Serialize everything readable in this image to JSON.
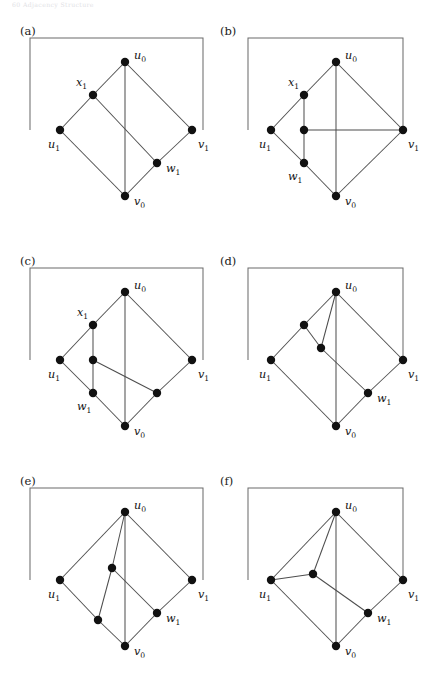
{
  "page": {
    "header_text": "60   Adjacency Structure",
    "background": "#ffffff",
    "node_color": "#111111",
    "edge_color": "#4d4d4d",
    "frame_color": "#6a6a6a",
    "width": 435,
    "height": 678
  },
  "figure": {
    "type": "graph-diagram-grid",
    "rows": 3,
    "cols": 2,
    "panel_count": 6
  },
  "panels": [
    {
      "id": "a",
      "label": "(a)",
      "origin": [
        20,
        20
      ],
      "frame": [
        [
          10,
          18
        ],
        [
          183,
          18
        ],
        [
          183,
          110
        ]
      ],
      "frame_left_end": [
        10,
        110
      ],
      "nodes": [
        {
          "name": "u0",
          "label": "u",
          "sub": "0",
          "x": 105,
          "y": 42,
          "lx": 114,
          "ly": 39
        },
        {
          "name": "x1",
          "label": "x",
          "sub": "1",
          "x": 73,
          "y": 75,
          "lx": 56,
          "ly": 66
        },
        {
          "name": "u1",
          "label": "u",
          "sub": "1",
          "x": 40,
          "y": 110,
          "lx": 28,
          "ly": 128
        },
        {
          "name": "v1",
          "label": "v",
          "sub": "1",
          "x": 172,
          "y": 110,
          "lx": 178,
          "ly": 128
        },
        {
          "name": "w1",
          "label": "w",
          "sub": "1",
          "x": 137,
          "y": 143,
          "lx": 146,
          "ly": 152
        },
        {
          "name": "v0",
          "label": "v",
          "sub": "0",
          "x": 105,
          "y": 176,
          "lx": 114,
          "ly": 185
        }
      ],
      "edges": [
        [
          "u1",
          "x1"
        ],
        [
          "x1",
          "u0"
        ],
        [
          "u0",
          "v1"
        ],
        [
          "u0",
          "v0"
        ],
        [
          "x1",
          "w1"
        ],
        [
          "u1",
          "v0"
        ],
        [
          "v0",
          "w1"
        ],
        [
          "w1",
          "v1"
        ]
      ]
    },
    {
      "id": "b",
      "label": "(b)",
      "origin": [
        220,
        20
      ],
      "frame": [
        [
          28,
          18
        ],
        [
          183,
          18
        ],
        [
          183,
          110
        ]
      ],
      "frame_left_end": [
        28,
        110
      ],
      "nodes": [
        {
          "name": "u0",
          "label": "u",
          "sub": "0",
          "x": 116,
          "y": 42,
          "lx": 125,
          "ly": 39
        },
        {
          "name": "x1",
          "label": "x",
          "sub": "1",
          "x": 84,
          "y": 75,
          "lx": 68,
          "ly": 66
        },
        {
          "name": "u1",
          "label": "u",
          "sub": "1",
          "x": 51,
          "y": 110,
          "lx": 39,
          "ly": 128
        },
        {
          "name": "m1",
          "label": "",
          "sub": "",
          "x": 84,
          "y": 110,
          "lx": 0,
          "ly": 0
        },
        {
          "name": "w1",
          "label": "w",
          "sub": "1",
          "x": 84,
          "y": 143,
          "lx": 68,
          "ly": 160
        },
        {
          "name": "v1",
          "label": "v",
          "sub": "1",
          "x": 183,
          "y": 110,
          "lx": 188,
          "ly": 128
        },
        {
          "name": "v0",
          "label": "v",
          "sub": "0",
          "x": 116,
          "y": 176,
          "lx": 125,
          "ly": 185
        }
      ],
      "edges": [
        [
          "u1",
          "x1"
        ],
        [
          "x1",
          "u0"
        ],
        [
          "u0",
          "v1"
        ],
        [
          "u0",
          "v0"
        ],
        [
          "x1",
          "m1"
        ],
        [
          "m1",
          "w1"
        ],
        [
          "m1",
          "v1"
        ],
        [
          "u1",
          "w1"
        ],
        [
          "w1",
          "v0"
        ],
        [
          "v0",
          "v1"
        ]
      ]
    },
    {
      "id": "c",
      "label": "(c)",
      "origin": [
        20,
        250
      ],
      "frame": [
        [
          10,
          18
        ],
        [
          183,
          18
        ],
        [
          183,
          110
        ]
      ],
      "frame_left_end": [
        10,
        110
      ],
      "nodes": [
        {
          "name": "u0",
          "label": "u",
          "sub": "0",
          "x": 105,
          "y": 42,
          "lx": 114,
          "ly": 39
        },
        {
          "name": "x1",
          "label": "x",
          "sub": "1",
          "x": 73,
          "y": 75,
          "lx": 57,
          "ly": 66
        },
        {
          "name": "u1",
          "label": "u",
          "sub": "1",
          "x": 40,
          "y": 110,
          "lx": 28,
          "ly": 128
        },
        {
          "name": "m1",
          "label": "",
          "sub": "",
          "x": 73,
          "y": 110,
          "lx": 0,
          "ly": 0
        },
        {
          "name": "w1",
          "label": "w",
          "sub": "1",
          "x": 73,
          "y": 143,
          "lx": 57,
          "ly": 160
        },
        {
          "name": "m2",
          "label": "",
          "sub": "",
          "x": 137,
          "y": 143,
          "lx": 0,
          "ly": 0
        },
        {
          "name": "v1",
          "label": "v",
          "sub": "1",
          "x": 172,
          "y": 110,
          "lx": 178,
          "ly": 128
        },
        {
          "name": "v0",
          "label": "v",
          "sub": "0",
          "x": 105,
          "y": 176,
          "lx": 114,
          "ly": 185
        }
      ],
      "edges": [
        [
          "u1",
          "x1"
        ],
        [
          "x1",
          "u0"
        ],
        [
          "u0",
          "v1"
        ],
        [
          "u0",
          "v0"
        ],
        [
          "x1",
          "m1"
        ],
        [
          "m1",
          "w1"
        ],
        [
          "m1",
          "m2"
        ],
        [
          "u1",
          "w1"
        ],
        [
          "w1",
          "v0"
        ],
        [
          "v0",
          "m2"
        ],
        [
          "m2",
          "v1"
        ]
      ]
    },
    {
      "id": "d",
      "label": "(d)",
      "origin": [
        220,
        250
      ],
      "frame": [
        [
          28,
          18
        ],
        [
          183,
          18
        ],
        [
          183,
          110
        ]
      ],
      "frame_left_end": [
        28,
        110
      ],
      "nodes": [
        {
          "name": "u0",
          "label": "u",
          "sub": "0",
          "x": 116,
          "y": 42,
          "lx": 125,
          "ly": 39
        },
        {
          "name": "m1",
          "label": "",
          "sub": "",
          "x": 84,
          "y": 75,
          "lx": 0,
          "ly": 0
        },
        {
          "name": "m2",
          "label": "",
          "sub": "",
          "x": 101,
          "y": 98,
          "lx": 0,
          "ly": 0
        },
        {
          "name": "u1",
          "label": "u",
          "sub": "1",
          "x": 51,
          "y": 110,
          "lx": 39,
          "ly": 128
        },
        {
          "name": "v1",
          "label": "v",
          "sub": "1",
          "x": 183,
          "y": 110,
          "lx": 188,
          "ly": 128
        },
        {
          "name": "w1",
          "label": "w",
          "sub": "1",
          "x": 148,
          "y": 143,
          "lx": 157,
          "ly": 152
        },
        {
          "name": "v0",
          "label": "v",
          "sub": "0",
          "x": 116,
          "y": 176,
          "lx": 125,
          "ly": 185
        }
      ],
      "edges": [
        [
          "u1",
          "m1"
        ],
        [
          "m1",
          "u0"
        ],
        [
          "m1",
          "m2"
        ],
        [
          "m2",
          "u0"
        ],
        [
          "u0",
          "v1"
        ],
        [
          "u0",
          "v0"
        ],
        [
          "m2",
          "w1"
        ],
        [
          "u1",
          "v0"
        ],
        [
          "v0",
          "w1"
        ],
        [
          "w1",
          "v1"
        ]
      ]
    },
    {
      "id": "e",
      "label": "(e)",
      "origin": [
        20,
        470
      ],
      "frame": [
        [
          10,
          18
        ],
        [
          183,
          18
        ],
        [
          183,
          110
        ]
      ],
      "frame_left_end": [
        10,
        110
      ],
      "nodes": [
        {
          "name": "u0",
          "label": "u",
          "sub": "0",
          "x": 105,
          "y": 42,
          "lx": 114,
          "ly": 39
        },
        {
          "name": "m1",
          "label": "",
          "sub": "",
          "x": 92,
          "y": 98,
          "lx": 0,
          "ly": 0
        },
        {
          "name": "u1",
          "label": "u",
          "sub": "1",
          "x": 40,
          "y": 110,
          "lx": 28,
          "ly": 128
        },
        {
          "name": "m2",
          "label": "",
          "sub": "",
          "x": 78,
          "y": 150,
          "lx": 0,
          "ly": 0
        },
        {
          "name": "v1",
          "label": "v",
          "sub": "1",
          "x": 172,
          "y": 110,
          "lx": 178,
          "ly": 128
        },
        {
          "name": "w1",
          "label": "w",
          "sub": "1",
          "x": 137,
          "y": 143,
          "lx": 146,
          "ly": 152
        },
        {
          "name": "v0",
          "label": "v",
          "sub": "0",
          "x": 105,
          "y": 176,
          "lx": 114,
          "ly": 185
        }
      ],
      "edges": [
        [
          "u1",
          "u0"
        ],
        [
          "m1",
          "u0"
        ],
        [
          "m1",
          "m2"
        ],
        [
          "m2",
          "v0"
        ],
        [
          "u0",
          "v1"
        ],
        [
          "u0",
          "v0"
        ],
        [
          "m1",
          "w1"
        ],
        [
          "u1",
          "m2"
        ],
        [
          "v0",
          "w1"
        ],
        [
          "w1",
          "v1"
        ]
      ]
    },
    {
      "id": "f",
      "label": "(f)",
      "origin": [
        220,
        470
      ],
      "frame": [
        [
          28,
          18
        ],
        [
          183,
          18
        ],
        [
          183,
          110
        ]
      ],
      "frame_left_end": [
        28,
        110
      ],
      "nodes": [
        {
          "name": "u0",
          "label": "u",
          "sub": "0",
          "x": 116,
          "y": 42,
          "lx": 125,
          "ly": 39
        },
        {
          "name": "m1",
          "label": "",
          "sub": "",
          "x": 93,
          "y": 104,
          "lx": 0,
          "ly": 0
        },
        {
          "name": "u1",
          "label": "u",
          "sub": "1",
          "x": 51,
          "y": 110,
          "lx": 39,
          "ly": 128
        },
        {
          "name": "v1",
          "label": "v",
          "sub": "1",
          "x": 183,
          "y": 110,
          "lx": 188,
          "ly": 128
        },
        {
          "name": "w1",
          "label": "w",
          "sub": "1",
          "x": 148,
          "y": 143,
          "lx": 157,
          "ly": 152
        },
        {
          "name": "v0",
          "label": "v",
          "sub": "0",
          "x": 116,
          "y": 176,
          "lx": 125,
          "ly": 185
        }
      ],
      "edges": [
        [
          "u1",
          "u0"
        ],
        [
          "u1",
          "m1"
        ],
        [
          "m1",
          "u0"
        ],
        [
          "m1",
          "w1"
        ],
        [
          "u0",
          "v1"
        ],
        [
          "u0",
          "v0"
        ],
        [
          "u1",
          "v0"
        ],
        [
          "v0",
          "w1"
        ],
        [
          "w1",
          "v1"
        ]
      ]
    }
  ]
}
